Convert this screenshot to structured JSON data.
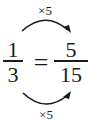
{
  "equation": {
    "left": {
      "numerator": "1",
      "denominator": "3"
    },
    "operator": "=",
    "right": {
      "numerator": "5",
      "denominator": "15"
    }
  },
  "arrows": {
    "top": {
      "label": "×5",
      "from": "numerator",
      "direction": "left-to-right"
    },
    "bottom": {
      "label": "×5",
      "from": "denominator",
      "direction": "left-to-right"
    }
  },
  "colors": {
    "ink": "#1a1a1a",
    "background": "#ffffff"
  }
}
